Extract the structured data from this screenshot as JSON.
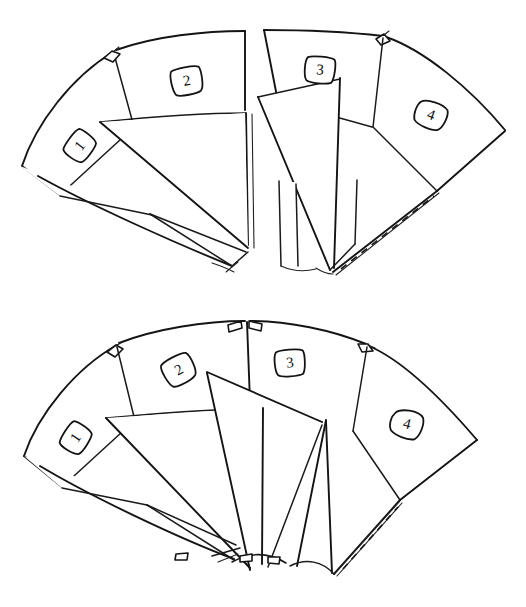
{
  "document": {
    "title": "Fan-fold panel diagram",
    "description": "Hand-drawn line diagram of two fan-shaped assemblies of four numbered panels with folded triangular flaps",
    "background_color": "#ffffff",
    "ink_color": "#141414",
    "dashed_fold_color": "#1a1a1a"
  },
  "figures": [
    {
      "id": "figure-top",
      "name": "top-fan-diagram",
      "panel_labels": [
        "1",
        "2",
        "3",
        "4"
      ],
      "label_positions": [
        {
          "label": "1",
          "x": 80,
          "y": 146,
          "rotate": -52
        },
        {
          "label": "2",
          "x": 187,
          "y": 81,
          "rotate": -10
        },
        {
          "label": "3",
          "x": 320,
          "y": 70,
          "rotate": 4
        },
        {
          "label": "4",
          "x": 431,
          "y": 115,
          "rotate": 20
        }
      ],
      "tab_count": 3,
      "dashed_fold_count": 2
    },
    {
      "id": "figure-bottom",
      "name": "bottom-fan-diagram",
      "panel_labels": [
        "1",
        "2",
        "3",
        "4"
      ],
      "label_positions": [
        {
          "label": "1",
          "x": 76,
          "y": 438,
          "rotate": -56
        },
        {
          "label": "2",
          "x": 179,
          "y": 370,
          "rotate": -28
        },
        {
          "label": "3",
          "x": 290,
          "y": 363,
          "rotate": -6
        },
        {
          "label": "4",
          "x": 407,
          "y": 424,
          "rotate": 14
        }
      ],
      "tab_count": 6,
      "dashed_fold_count": 1
    }
  ]
}
